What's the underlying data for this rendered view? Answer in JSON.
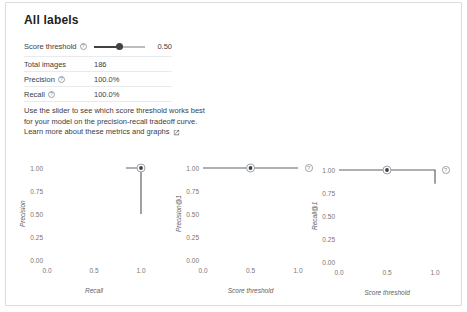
{
  "panel": {
    "title": "All labels",
    "rows": [
      {
        "label": "Score threshold",
        "value": "0.50",
        "has_help": true
      },
      {
        "label": "Total images",
        "value": "186",
        "has_help": false
      },
      {
        "label": "Precision",
        "value": "100.0%",
        "has_help": true
      },
      {
        "label": "Recall",
        "value": "100.0%",
        "has_help": true
      }
    ],
    "slider": {
      "value": 0.5,
      "display": "0.50",
      "min": 0,
      "max": 1
    },
    "description": {
      "line1": "Use the slider to see which score threshold works best",
      "line2": "for your model on the precision-recall tradeoff curve.",
      "link_text": "Learn more about these metrics and graphs"
    }
  },
  "colors": {
    "line": "#5f6368",
    "marker_ring": "#9aa0a6",
    "marker_dot": "#3c4043",
    "track_filled": "#424242",
    "track_empty": "#bdbdbd",
    "border": "#dadce0"
  },
  "chart_data": [
    {
      "type": "line",
      "title": "",
      "xlabel": "Recall",
      "ylabel": "Precision",
      "x": [
        0.84,
        1.0,
        1.0
      ],
      "y": [
        1.0,
        1.0,
        0.5
      ],
      "marker": {
        "x": 1.0,
        "y": 1.0
      },
      "xticks": [
        "0.0",
        "0.5",
        "1.0"
      ],
      "yticks": [
        "1.00",
        "0.75",
        "0.50",
        "0.25",
        "0.00"
      ],
      "xlim": [
        0,
        1
      ],
      "ylim": [
        0,
        1
      ],
      "grid": false,
      "legend": false,
      "help_icon": false
    },
    {
      "type": "line",
      "title": "",
      "xlabel": "Score threshold",
      "ylabel": "Precision@1",
      "x": [
        0.0,
        1.0
      ],
      "y": [
        1.0,
        1.0
      ],
      "marker": {
        "x": 0.5,
        "y": 1.0
      },
      "xticks": [
        "0.0",
        "0.5",
        "1.0"
      ],
      "yticks": [
        "1.00",
        "0.75",
        "0.50",
        "0.25",
        "0.00"
      ],
      "xlim": [
        0,
        1
      ],
      "ylim": [
        0,
        1
      ],
      "grid": false,
      "legend": false,
      "help_icon": true
    },
    {
      "type": "line",
      "title": "",
      "xlabel": "Score threshold",
      "ylabel": "Recall@1",
      "x": [
        0.0,
        1.0,
        1.0
      ],
      "y": [
        1.0,
        1.0,
        0.85
      ],
      "marker": {
        "x": 0.5,
        "y": 1.0
      },
      "xticks": [
        "0.0",
        "0.5",
        "1.0"
      ],
      "yticks": [
        "1.00",
        "0.75",
        "0.50",
        "0.25",
        "0.00"
      ],
      "xlim": [
        0,
        1
      ],
      "ylim": [
        0,
        1
      ],
      "grid": false,
      "legend": false,
      "help_icon": true
    }
  ]
}
